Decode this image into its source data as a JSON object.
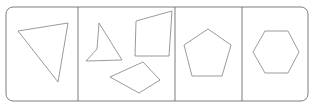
{
  "figure": {
    "background_color": "#ffffff",
    "stroke_color": "#808080",
    "frame_stroke_color": "#6e6e6e",
    "stroke_width": 0.8,
    "fill": "none"
  },
  "frame": {
    "x": 6,
    "y": 7,
    "width": 302,
    "height": 94,
    "corner_radius": 7
  },
  "dividers": [
    {
      "name": "divider-1",
      "x": 78,
      "y1": 7,
      "y2": 101
    },
    {
      "name": "divider-2",
      "x": 175,
      "y1": 7,
      "y2": 101
    },
    {
      "name": "divider-3",
      "x": 242,
      "y1": 7,
      "y2": 101
    }
  ],
  "panels": [
    {
      "index": 1,
      "name": "panel-triangle",
      "shape_count": 1,
      "shapes": [
        {
          "name": "triangle",
          "sides": 3,
          "points": "18,31 68,23 58,82"
        }
      ]
    },
    {
      "index": 2,
      "name": "panel-quadrilaterals",
      "shape_count": 3,
      "shapes": [
        {
          "name": "concave-quadrilateral-arrow",
          "sides": 4,
          "points": "99,23 122,60 86,61 97,49"
        },
        {
          "name": "quadrilateral-trapezoid",
          "sides": 4,
          "points": "136,21 172,11 169,56 135,56"
        },
        {
          "name": "rotated-rectangle",
          "sides": 4,
          "points": "110,77 143,62 160,80 139,93"
        }
      ]
    },
    {
      "index": 3,
      "name": "panel-pentagon",
      "shape_count": 1,
      "shapes": [
        {
          "name": "pentagon",
          "sides": 5,
          "points": "208,29 231,45 222,76 192,76 184,45"
        }
      ]
    },
    {
      "index": 4,
      "name": "panel-hexagon",
      "shape_count": 1,
      "shapes": [
        {
          "name": "hexagon",
          "sides": 6,
          "points": "265,31 288,31 299,52 288,73 265,73 253,52"
        }
      ]
    }
  ]
}
